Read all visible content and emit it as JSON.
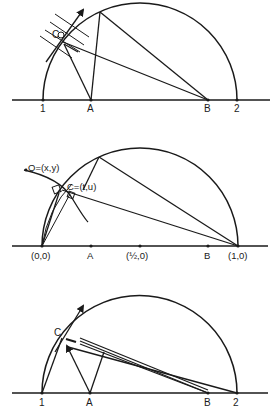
{
  "figures": [
    {
      "id": "figure-1",
      "axis_labels": {
        "p1": "1",
        "pA": "A",
        "pB": "B",
        "p2": "2"
      },
      "point_labels": {
        "C": "C"
      }
    },
    {
      "id": "figure-2",
      "axis_labels": {
        "origin": "(0,0)",
        "pA": "A",
        "half": "(½,0)",
        "pB": "B",
        "one": "(1,0)"
      },
      "point_labels": {
        "Q": "Q=(x,y)",
        "C": "C=(t,u)"
      }
    },
    {
      "id": "figure-3",
      "axis_labels": {
        "p1": "1",
        "pA": "A",
        "pB": "B",
        "p2": "2"
      },
      "point_labels": {
        "C": "C"
      }
    }
  ]
}
